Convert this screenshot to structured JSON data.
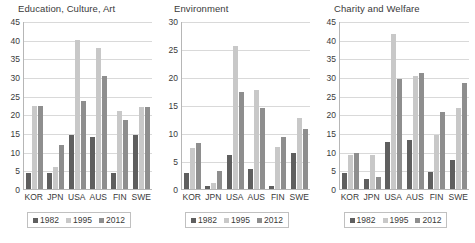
{
  "chart_data": [
    {
      "type": "bar",
      "title": "Education, Culture, Art",
      "xlabel": "",
      "ylabel": "",
      "ylim": [
        0,
        45
      ],
      "yticks": [
        0,
        5,
        10,
        15,
        20,
        25,
        30,
        35,
        40,
        45
      ],
      "grid": true,
      "legend_position": "bottom",
      "categories": [
        "KOR",
        "JPN",
        "USA",
        "AUS",
        "FIN",
        "SWE"
      ],
      "series": [
        {
          "name": "1982",
          "color": "#5f5f5f",
          "values": [
            4.2,
            4.2,
            14.6,
            13.9,
            4.4,
            14.6
          ]
        },
        {
          "name": "1995",
          "color": "#c8c8c8",
          "values": [
            22.3,
            5.9,
            39.8,
            37.7,
            20.8,
            21.9
          ]
        },
        {
          "name": "2012",
          "color": "#8e8e8e",
          "values": [
            22.3,
            11.9,
            23.5,
            30.2,
            18.4,
            21.9
          ]
        }
      ]
    },
    {
      "type": "bar",
      "title": "Environment",
      "xlabel": "",
      "ylabel": "",
      "ylim": [
        0,
        30
      ],
      "yticks": [
        0,
        5,
        10,
        15,
        20,
        25,
        30
      ],
      "grid": true,
      "legend_position": "bottom",
      "categories": [
        "KOR",
        "JPN",
        "USA",
        "AUS",
        "FIN",
        "SWE"
      ],
      "series": [
        {
          "name": "1982",
          "color": "#5f5f5f",
          "values": [
            2.8,
            0.5,
            6.0,
            3.5,
            0.6,
            6.4
          ]
        },
        {
          "name": "1995",
          "color": "#c8c8c8",
          "values": [
            7.3,
            1.0,
            25.5,
            17.6,
            7.5,
            12.6
          ]
        },
        {
          "name": "2012",
          "color": "#8e8e8e",
          "values": [
            8.3,
            3.3,
            17.4,
            14.4,
            9.3,
            10.8
          ]
        }
      ]
    },
    {
      "type": "bar",
      "title": "Charity and Welfare",
      "xlabel": "",
      "ylabel": "",
      "ylim": [
        0,
        45
      ],
      "yticks": [
        0,
        5,
        10,
        15,
        20,
        25,
        30,
        35,
        40,
        45
      ],
      "grid": true,
      "legend_position": "bottom",
      "categories": [
        "KOR",
        "JPN",
        "USA",
        "AUS",
        "FIN",
        "SWE"
      ],
      "series": [
        {
          "name": "1982",
          "color": "#5f5f5f",
          "values": [
            4.4,
            2.7,
            12.7,
            13.0,
            4.5,
            7.9
          ]
        },
        {
          "name": "1995",
          "color": "#c8c8c8",
          "values": [
            9.0,
            9.2,
            41.6,
            30.3,
            14.5,
            21.8
          ]
        },
        {
          "name": "2012",
          "color": "#8e8e8e",
          "values": [
            9.7,
            3.1,
            29.6,
            31.2,
            20.6,
            28.5
          ]
        }
      ]
    }
  ]
}
